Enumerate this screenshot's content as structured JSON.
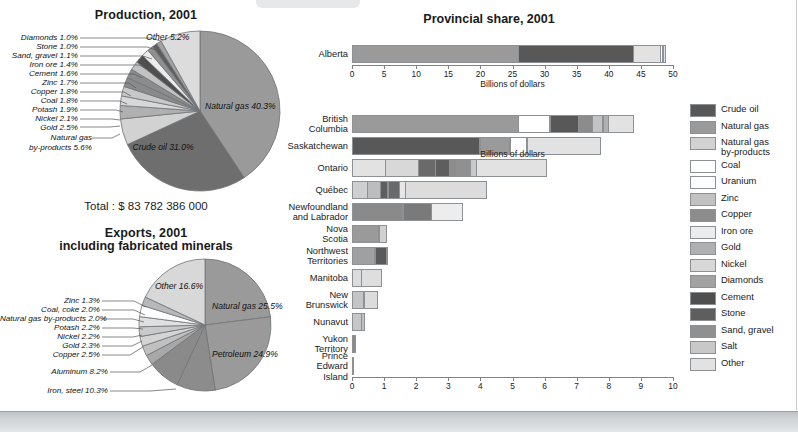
{
  "colors": {
    "crude_oil": "#585858",
    "natural_gas": "#9a9a9a",
    "ng_byproducts": "#d2d2d2",
    "coal": "#ffffff",
    "uranium": "#fdfdfd",
    "zinc": "#c2c2c2",
    "copper": "#8c8c8c",
    "iron_ore": "#ececec",
    "gold": "#b0b0b0",
    "nickel": "#d8d8d8",
    "diamonds": "#a2a2a2",
    "cement": "#4f4f4f",
    "stone": "#5e5e5e",
    "sand_gravel": "#909090",
    "salt": "#c8c8c8",
    "other": "#e2e2e2",
    "outline": "#8d9194",
    "axis": "#7d8285"
  },
  "legend": {
    "items": [
      {
        "label": "Crude oil",
        "color": "#585858"
      },
      {
        "label": "Natural gas",
        "color": "#9a9a9a"
      },
      {
        "label": "Natural gas\nby-products",
        "color": "#d2d2d2"
      },
      {
        "label": "Coal",
        "color": "#ffffff"
      },
      {
        "label": "Uranium",
        "color": "#fdfdfd"
      },
      {
        "label": "Zinc",
        "color": "#c2c2c2"
      },
      {
        "label": "Copper",
        "color": "#8c8c8c"
      },
      {
        "label": "Iron ore",
        "color": "#ececec"
      },
      {
        "label": "Gold",
        "color": "#b0b0b0"
      },
      {
        "label": "Nickel",
        "color": "#d8d8d8"
      },
      {
        "label": "Diamonds",
        "color": "#a2a2a2"
      },
      {
        "label": "Cement",
        "color": "#4f4f4f"
      },
      {
        "label": "Stone",
        "color": "#5e5e5e"
      },
      {
        "label": "Sand, gravel",
        "color": "#909090"
      },
      {
        "label": "Salt",
        "color": "#c8c8c8"
      },
      {
        "label": "Other",
        "color": "#e2e2e2"
      }
    ]
  },
  "chart_data": [
    {
      "type": "pie",
      "id": "production",
      "title": "Production, 2001",
      "subtitle": "",
      "total_label": "Total : $ 83 782 386 000",
      "total_value": 83782386000,
      "unit": "dollars",
      "labels": [
        "Natural gas",
        "Crude oil",
        "Natural gas by-products",
        "Gold",
        "Nickel",
        "Potash",
        "Coal",
        "Copper",
        "Zinc",
        "Cement",
        "Iron ore",
        "Sand, gravel",
        "Stone",
        "Diamonds",
        "Other"
      ],
      "values": [
        40.3,
        31.0,
        5.6,
        2.5,
        2.1,
        1.9,
        1.8,
        1.8,
        1.7,
        1.6,
        1.4,
        1.1,
        1.0,
        1.0,
        5.2
      ],
      "value_labels": [
        "Natural gas 40.3%",
        "Crude oil 31.0%",
        "Natural gas by-products 5.6%",
        "Gold 2.5%",
        "Nickel 2.1%",
        "Potash 1.9%",
        "Coal 1.8%",
        "Copper 1.8%",
        "Zinc 1.7%",
        "Cement 1.6%",
        "Iron ore 1.4%",
        "Sand, gravel 1.1%",
        "Stone 1.0%",
        "Diamonds 1.0%",
        "Other 5.2%"
      ],
      "slice_colors": [
        "#9a9a9a",
        "#6e6e6e",
        "#d2d2d2",
        "#b0b0b0",
        "#d8d8d8",
        "#c8c8c8",
        "#8a8a8a",
        "#8c8c8c",
        "#c2c2c2",
        "#4f4f4f",
        "#ececec",
        "#909090",
        "#5e5e5e",
        "#a2a2a2",
        "#dcdcdc"
      ],
      "callout_labels": [
        "Diamonds 1.0%",
        "Stone 1.0%",
        "Sand, gravel 1.1%",
        "Iron ore 1.4%",
        "Cement 1.6%",
        "Zinc 1.7%",
        "Copper 1.8%",
        "Coal 1.8%",
        "Potash 1.9%",
        "Nickel 2.1%",
        "Gold 2.5%"
      ],
      "inside_labels": [
        "Natural gas\n40.3%",
        "Crude oil\n31.0%",
        "Other\n5.2%",
        "Natural gas\nby-products 5.6%"
      ]
    },
    {
      "type": "pie",
      "id": "exports",
      "title": "Exports, 2001",
      "subtitle": "including fabricated minerals",
      "total_label": "Total : $ 100 173 155 000",
      "total_value": 100173155000,
      "unit": "dollars",
      "labels": [
        "Natural gas",
        "Petroleum",
        "Iron, steel",
        "Aluminum",
        "Copper",
        "Gold",
        "Nickel",
        "Potash",
        "Natural gas by-products",
        "Coal, coke",
        "Zinc",
        "Other"
      ],
      "values": [
        25.5,
        24.9,
        10.3,
        8.2,
        2.5,
        2.3,
        2.2,
        2.2,
        2.0,
        2.0,
        1.3,
        16.6
      ],
      "value_labels": [
        "Natural gas 25.5%",
        "Petroleum 24.9%",
        "Iron, steel 10.3%",
        "Aluminum 8.2%",
        "Copper 2.5%",
        "Gold 2.3%",
        "Nickel 2.2%",
        "Potash 2.2%",
        "Natural gas by-products 2.0%",
        "Coal, coke 2.0%",
        "Zinc 1.3%",
        "Other 16.6%"
      ],
      "slice_colors": [
        "#9a9a9a",
        "#9a9a9a",
        "#8c8c8c",
        "#8a8a8a",
        "#a8a8a8",
        "#c0c0c0",
        "#d4d4d4",
        "#cacaca",
        "#e0e0e0",
        "#ffffff",
        "#b8b8b8",
        "#d8d8d8"
      ],
      "callout_labels": [
        "Zinc 1.3%",
        "Coal, coke 2.0%",
        "Natural gas by-products 2.0%",
        "Potash 2.2%",
        "Nickel 2.2%",
        "Gold 2.3%",
        "Copper 2.5%",
        "Aluminum 8.2%",
        "Iron, steel 10.3%"
      ],
      "inside_labels": [
        "Natural gas\n25.5%",
        "Petroleum\n24.9%",
        "Other\n16.6%"
      ]
    },
    {
      "type": "bar",
      "id": "provincial-alberta",
      "orientation": "horizontal",
      "stacked": true,
      "title": "Provincial share, 2001",
      "xlabel": "Billions of dollars",
      "xlim": [
        0,
        50
      ],
      "xticks": [
        0,
        5,
        10,
        15,
        20,
        25,
        30,
        35,
        40,
        45,
        50
      ],
      "grid": false,
      "categories": [
        "Alberta"
      ],
      "series": [
        {
          "name": "Natural gas",
          "color": "#9a9a9a",
          "values": [
            26.0
          ]
        },
        {
          "name": "Crude oil",
          "color": "#585858",
          "values": [
            18.0
          ]
        },
        {
          "name": "Natural gas by-products",
          "color": "#e2e2e2",
          "values": [
            4.3
          ]
        },
        {
          "name": "Coal",
          "color": "#ffffff",
          "values": [
            0.45
          ]
        },
        {
          "name": "Other",
          "color": "#e2e2e2",
          "values": [
            0.55
          ]
        }
      ],
      "totals": [
        49.3
      ]
    },
    {
      "type": "bar",
      "id": "provincial-rest",
      "orientation": "horizontal",
      "stacked": true,
      "title": "",
      "xlabel": "Billions of dollars",
      "xlim": [
        0,
        10
      ],
      "xticks": [
        0,
        1,
        2,
        3,
        4,
        5,
        6,
        7,
        8,
        9,
        10
      ],
      "grid": false,
      "categories": [
        "British\nColumbia",
        "Saskatchewan",
        "Ontario",
        "Québec",
        "Newfoundland\nand Labrador",
        "Nova Scotia",
        "Northwest\nTerritories",
        "Manitoba",
        "New\nBrunswick",
        "Nunavut",
        "Yukon Territory",
        "Prince Edward\nIsland"
      ],
      "totals": [
        8.9,
        7.8,
        6.2,
        4.3,
        3.5,
        1.1,
        1.15,
        0.95,
        0.82,
        0.42,
        0.12,
        0.02
      ],
      "stacks": [
        [
          {
            "name": "Natural gas",
            "color": "#9a9a9a",
            "value": 5.2
          },
          {
            "name": "Coal",
            "color": "#ffffff",
            "value": 1.0
          },
          {
            "name": "Crude oil",
            "color": "#585858",
            "value": 0.9
          },
          {
            "name": "Copper",
            "color": "#8c8c8c",
            "value": 0.45
          },
          {
            "name": "Zinc",
            "color": "#c2c2c2",
            "value": 0.35
          },
          {
            "name": "Gold",
            "color": "#b0b0b0",
            "value": 0.2
          },
          {
            "name": "Other",
            "color": "#e2e2e2",
            "value": 0.8
          }
        ],
        [
          {
            "name": "Crude oil",
            "color": "#585858",
            "value": 4.0
          },
          {
            "name": "Natural gas",
            "color": "#9a9a9a",
            "value": 0.95
          },
          {
            "name": "Uranium",
            "color": "#ffffff",
            "value": 0.55
          },
          {
            "name": "Other",
            "color": "#e2e2e2",
            "value": 2.3
          }
        ],
        [
          {
            "name": "Natural gas by-products",
            "color": "#e2e2e2",
            "value": 1.05
          },
          {
            "name": "Nickel",
            "color": "#d8d8d8",
            "value": 1.05
          },
          {
            "name": "Cement",
            "color": "#6a6a6a",
            "value": 0.55
          },
          {
            "name": "Stone",
            "color": "#5e5e5e",
            "value": 0.45
          },
          {
            "name": "Copper",
            "color": "#8c8c8c",
            "value": 0.25
          },
          {
            "name": "Sand, gravel",
            "color": "#909090",
            "value": 0.45
          },
          {
            "name": "Salt",
            "color": "#c8c8c8",
            "value": 0.2
          },
          {
            "name": "Other",
            "color": "#e2e2e2",
            "value": 2.2
          }
        ],
        [
          {
            "name": "Iron ore",
            "color": "#cfcfcf",
            "value": 0.5
          },
          {
            "name": "Nickel",
            "color": "#bdbdbd",
            "value": 0.42
          },
          {
            "name": "Cement",
            "color": "#5e5e5e",
            "value": 0.25
          },
          {
            "name": "Stone",
            "color": "#6a6a6a",
            "value": 0.38
          },
          {
            "name": "Salt",
            "color": "#e6e6e6",
            "value": 0.2
          },
          {
            "name": "Other",
            "color": "#dcdcdc",
            "value": 2.55
          }
        ],
        [
          {
            "name": "Crude oil",
            "color": "#8a8a8a",
            "value": 1.6
          },
          {
            "name": "Iron ore",
            "color": "#7a7a7a",
            "value": 0.9
          },
          {
            "name": "Other",
            "color": "#ededed",
            "value": 1.0
          }
        ],
        [
          {
            "name": "Natural gas",
            "color": "#9a9a9a",
            "value": 0.85
          },
          {
            "name": "Other",
            "color": "#d0d0d0",
            "value": 0.25
          }
        ],
        [
          {
            "name": "Natural gas",
            "color": "#a0a0a0",
            "value": 0.72
          },
          {
            "name": "Diamonds",
            "color": "#5a5a5a",
            "value": 0.38
          },
          {
            "name": "Other",
            "color": "#d8d8d8",
            "value": 0.05
          }
        ],
        [
          {
            "name": "Nickel",
            "color": "#dcdcdc",
            "value": 0.3
          },
          {
            "name": "Other",
            "color": "#dedede",
            "value": 0.65
          }
        ],
        [
          {
            "name": "Zinc",
            "color": "#c4c4c4",
            "value": 0.38
          },
          {
            "name": "Other",
            "color": "#dcdcdc",
            "value": 0.44
          }
        ],
        [
          {
            "name": "Gold",
            "color": "#c6c6c6",
            "value": 0.3
          },
          {
            "name": "Other",
            "color": "#c0c0c0",
            "value": 0.12
          }
        ],
        [
          {
            "name": "Gold",
            "color": "#8a8a8a",
            "value": 0.12
          }
        ],
        [
          {
            "name": "Other",
            "color": "#cccccc",
            "value": 0.02
          }
        ]
      ]
    }
  ]
}
